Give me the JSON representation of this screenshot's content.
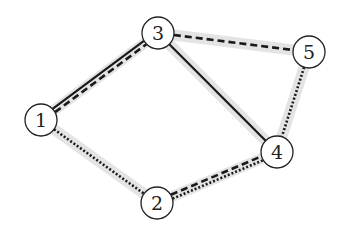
{
  "diagram": {
    "type": "graph",
    "nodes": [
      {
        "id": "1",
        "label": "1",
        "x": 41,
        "y": 120
      },
      {
        "id": "2",
        "label": "2",
        "x": 157,
        "y": 203
      },
      {
        "id": "3",
        "label": "3",
        "x": 158,
        "y": 33
      },
      {
        "id": "4",
        "label": "4",
        "x": 277,
        "y": 152
      },
      {
        "id": "5",
        "label": "5",
        "x": 309,
        "y": 52
      }
    ],
    "edges": [
      {
        "from": "1",
        "to": "3",
        "styles": [
          "solid",
          "dashed"
        ]
      },
      {
        "from": "3",
        "to": "4",
        "styles": [
          "solid"
        ]
      },
      {
        "from": "3",
        "to": "5",
        "styles": [
          "dashed"
        ]
      },
      {
        "from": "5",
        "to": "4",
        "styles": [
          "dotted"
        ]
      },
      {
        "from": "1",
        "to": "2",
        "styles": [
          "dotted"
        ]
      },
      {
        "from": "2",
        "to": "4",
        "styles": [
          "dashed",
          "dotted"
        ]
      }
    ],
    "colors": {
      "edge": "#1a1a1a",
      "highlight": "#e4e4e4",
      "node_stroke": "#222222",
      "node_fill": "#ffffff"
    }
  }
}
